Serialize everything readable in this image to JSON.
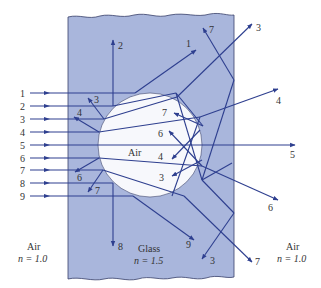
{
  "colors": {
    "glass": "#a9b6dc",
    "glass_edge": "#38406a",
    "hole": "#f7f8fc",
    "ray": "#2e3f8f",
    "text": "#333333"
  },
  "media": {
    "left": {
      "name": "Air",
      "index": "n = 1.0"
    },
    "glass": {
      "name": "Glass",
      "index": "n = 1.5"
    },
    "hole": {
      "name": "Air"
    },
    "right": {
      "name": "Air",
      "index": "n = 1.0"
    }
  },
  "incident_rays": [
    "1",
    "2",
    "3",
    "4",
    "5",
    "6",
    "7",
    "8",
    "9"
  ],
  "exit_labels": {
    "top_2": "2",
    "top_1": "1",
    "top_7": "7",
    "top_3": "3",
    "right_4": "4",
    "right_5": "5",
    "right_6": "6",
    "bottom_7": "7",
    "bottom_3": "3",
    "bottom_9": "9",
    "bottom_8": "8",
    "inner_3": "3",
    "inner_4": "4",
    "left_6": "6",
    "left_7": "7",
    "hole_7": "7",
    "hole_6": "6",
    "hole_4": "4",
    "hole_3": "3"
  }
}
